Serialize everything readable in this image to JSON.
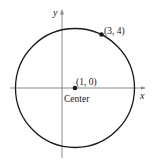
{
  "diagram": {
    "axes": {
      "x_label": "x",
      "y_label": "y"
    },
    "circle": {
      "center_label": "(1, 0)",
      "center_caption": "Center",
      "point_label": "(3, 4)"
    },
    "colors": {
      "stroke": "#1a1a1a",
      "axis": "#8a8a8a",
      "background": "#ffffff"
    }
  }
}
